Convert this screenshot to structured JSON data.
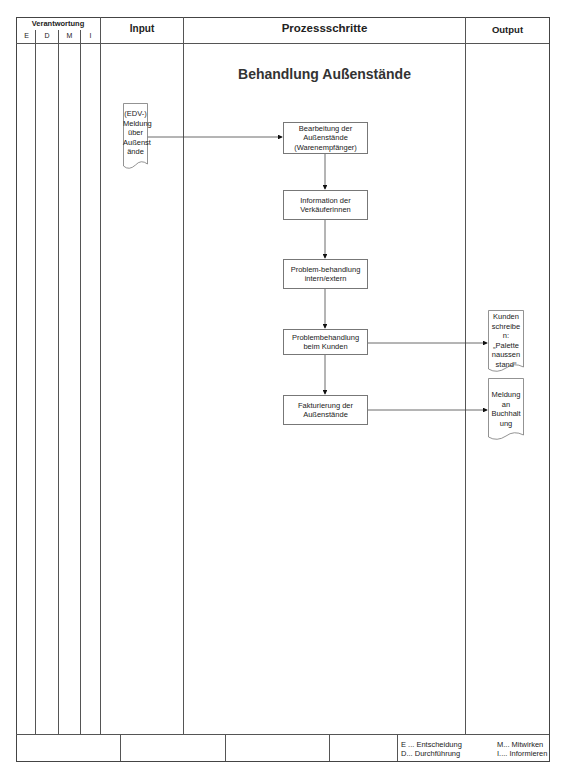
{
  "header": {
    "responsibility": "Verantwortung",
    "roles": [
      "E",
      "D",
      "M",
      "I"
    ],
    "input": "Input",
    "process": "Prozessschritte",
    "output": "Output"
  },
  "diagram_title": "Behandlung Außenstände",
  "input_doc": [
    "(EDV-)",
    "Meldung",
    "über",
    "Außenst",
    "ände"
  ],
  "process_steps": [
    [
      "Bearbeitung der",
      "Außenstände",
      "(Warenempfänger)"
    ],
    [
      "Information der",
      "Verkäuferinnen"
    ],
    [
      "Problem-behandlung",
      "intern/extern"
    ],
    [
      "Problembehandlung",
      "beim Kunden"
    ],
    [
      "Fakturierung der",
      "Außenstände"
    ]
  ],
  "output_docs": [
    [
      "Kunden",
      "schreibe",
      "n:",
      "„Palette",
      "naussen",
      "stand“"
    ],
    [
      "Meldung",
      "an",
      "Buchhalt",
      "ung"
    ]
  ],
  "legend": {
    "e": "E ... Entscheidung",
    "d": "D... Durchführung",
    "m": "M... Mitwirken",
    "i": "I.... Informieren"
  }
}
